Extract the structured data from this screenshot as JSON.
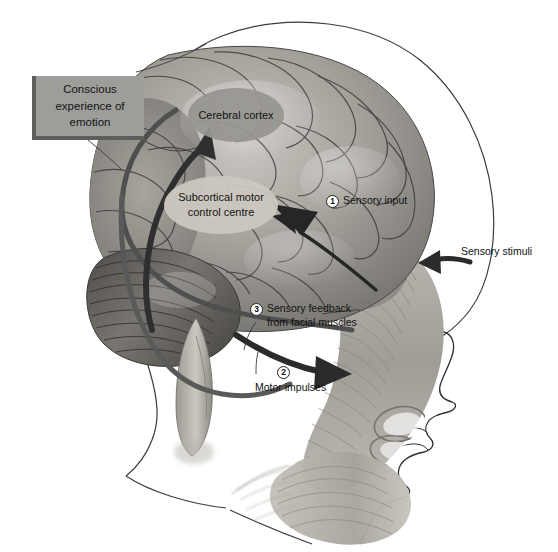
{
  "figure": {
    "type": "anatomical-diagram",
    "palette": {
      "callout_fill": "#9d9d9a",
      "callout_shadow": "#5d5d5b",
      "cortex_ellipse": "#97948f",
      "subcortical_ellipse": "#cbc7bf",
      "arrow_dark": "#2f2f2f",
      "arrow_mid": "#585858",
      "outline": "#3a3a3a",
      "background": "#ffffff"
    }
  },
  "callout": {
    "text_lines": [
      "Conscious",
      "experience of",
      "emotion"
    ],
    "text": "Conscious experience of emotion"
  },
  "regions": [
    {
      "name": "cerebral-cortex",
      "lines": [
        "Cerebral",
        "cortex"
      ],
      "text": "Cerebral cortex"
    },
    {
      "name": "subcortical-motor-control-centre",
      "lines": [
        "Subcortical",
        "motor control",
        "centre"
      ],
      "text": "Subcortical motor control centre"
    }
  ],
  "steps": [
    {
      "number": "1",
      "line1": "Sensory input",
      "line2": ""
    },
    {
      "number": "2",
      "line1": "Motor impulses",
      "line2": ""
    },
    {
      "number": "3",
      "line1": "Sensory feedback",
      "line2": "from facial muscles"
    }
  ],
  "annotations": [
    {
      "name": "sensory-stimuli",
      "text": "Sensory stimuli"
    }
  ]
}
